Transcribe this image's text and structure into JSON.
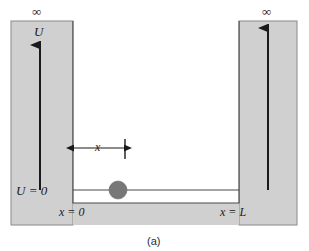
{
  "figure": {
    "caption": "(a)",
    "labels": {
      "infinity_left": "∞",
      "infinity_right": "∞",
      "potential_symbol": "U",
      "potential_zero": "U = 0",
      "x_origin": "x = 0",
      "x_length": "x = L",
      "x_dimension": "x"
    },
    "colors": {
      "wall_fill": "#d0d0d0",
      "wall_stroke": "#8a8a8a",
      "well_fill": "#ffffff",
      "line_stroke": "#4a4a4a",
      "arrow_stroke": "#1a1a1a",
      "particle_fill": "#777777",
      "text": "#1a1a1a",
      "page_background": "#ffffff"
    },
    "geometry": {
      "canvas_width": 309,
      "canvas_height": 251,
      "gray_left": 11,
      "gray_right": 297,
      "gray_top": 21,
      "gray_bottom": 225,
      "well_left": 73,
      "well_right": 239,
      "well_floor": 203,
      "baseline_y": 190,
      "left_arrow_x": 40,
      "left_arrow_top": 45,
      "right_arrow_x": 268,
      "right_arrow_top": 28,
      "dimension_y": 148,
      "dimension_tick_x": 125,
      "particle_cx": 118,
      "particle_cy": 190,
      "particle_r": 9
    }
  }
}
